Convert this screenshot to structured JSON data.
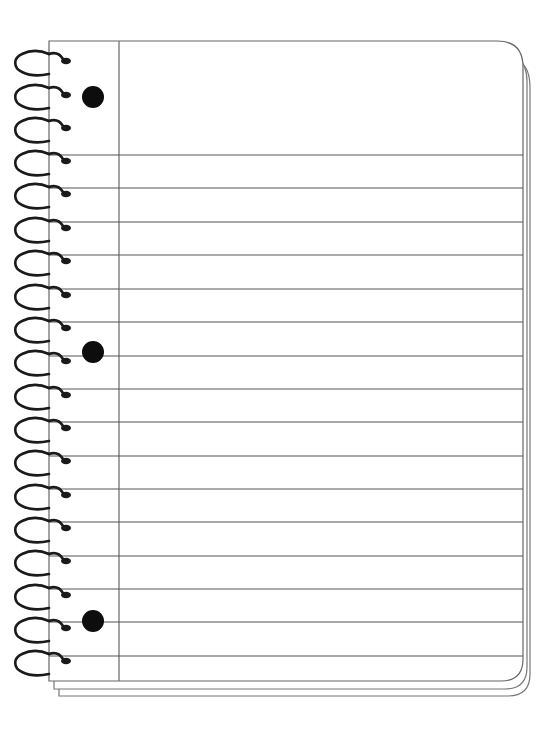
{
  "notebook": {
    "sheets_behind": 2,
    "ruled_line_count": 16,
    "ring_count": 19,
    "punch_hole_count": 3,
    "colors": {
      "paper": "#ffffff",
      "rule_line": "#555555",
      "page_outline": "#666666",
      "ring": "#1a1a1a",
      "punch_hole": "#0d0d0d"
    }
  }
}
